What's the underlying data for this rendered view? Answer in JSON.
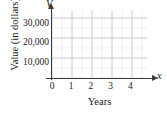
{
  "figure": {
    "y_axis_title": "Value (in dollars)",
    "x_axis_title": "Years",
    "y_axis_variable": "V",
    "x_axis_variable": "x",
    "origin_label": "0"
  },
  "chart_data": {
    "type": "line",
    "title": "",
    "subtitle": "",
    "xlabel": "Years",
    "ylabel": "Value (in dollars)",
    "x_axis_variable": "x",
    "y_axis_variable": "V",
    "xlim": [
      0,
      4.75
    ],
    "ylim": [
      0,
      34000
    ],
    "x_major_ticks": [
      0,
      1,
      2,
      3,
      4
    ],
    "x_tick_labels": [
      "0",
      "1",
      "2",
      "3",
      "4"
    ],
    "x_minor_step": 0.5,
    "y_major_ticks": [
      10000,
      20000,
      30000
    ],
    "y_tick_labels": [
      "10,000",
      "20,000",
      "30,000"
    ],
    "y_minor_step": 5000,
    "grid": true,
    "grid_major_color": "#c8c8c8",
    "grid_minor_color": "#e4e4e4",
    "axis_color": "#3a3a3a",
    "legend": null,
    "series": [],
    "values": [],
    "annotations": [],
    "note": "empty coordinate grid; no data plotted"
  }
}
